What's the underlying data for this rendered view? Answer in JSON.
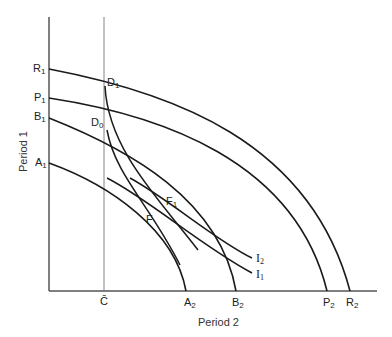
{
  "diagram": {
    "axes": {
      "y_label": "Period 1",
      "x_label": "Period 2"
    },
    "x_ticks": {
      "c_bar": "C̄"
    },
    "y_labels": [
      {
        "base": "R",
        "sub": "1"
      },
      {
        "base": "P",
        "sub": "1"
      },
      {
        "base": "B",
        "sub": "1"
      },
      {
        "base": "A",
        "sub": "1"
      }
    ],
    "x_labels": [
      {
        "base": "A",
        "sub": "2"
      },
      {
        "base": "B",
        "sub": "2"
      },
      {
        "base": "P",
        "sub": "2"
      },
      {
        "base": "R",
        "sub": "2"
      }
    ],
    "points": [
      {
        "base": "D",
        "sub": "1"
      },
      {
        "base": "D",
        "sub": "0"
      },
      {
        "base": "F",
        "sub": "1"
      },
      {
        "base": "F",
        "sub": ""
      }
    ],
    "indifference": [
      {
        "base": "I",
        "sub": "2"
      },
      {
        "base": "I",
        "sub": "1"
      }
    ],
    "colors": {
      "line": "#1a1a1a",
      "thin_line": "#555555",
      "background": "#ffffff"
    }
  }
}
